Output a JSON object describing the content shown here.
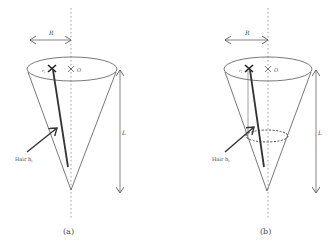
{
  "figure": {
    "panels": [
      {
        "id": "a",
        "caption": "(a)",
        "radius_label": "R",
        "length_label": "L",
        "origin_label": "O",
        "hair_label": "Hair h",
        "hair_subscript": "i",
        "root_label": "r",
        "root_subscript": "i"
      },
      {
        "id": "b",
        "caption": "(b)",
        "radius_label": "R",
        "length_label": "L",
        "origin_label": "O",
        "hair_label": "Hair h",
        "hair_subscript": "i",
        "root_label": "r",
        "root_subscript": "i"
      }
    ],
    "colors": {
      "line": "#555555",
      "hair": "#333333",
      "axis": "#999999",
      "background": "#ffffff"
    }
  }
}
